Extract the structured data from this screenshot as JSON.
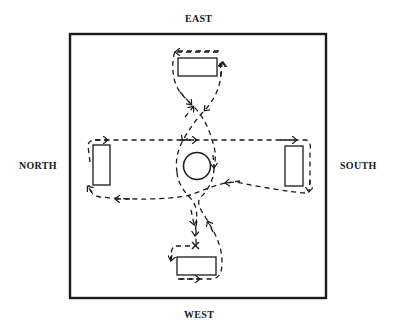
{
  "labels": {
    "top": "EAST",
    "left": "NORTH",
    "right": "SOUTH",
    "bottom": "WEST"
  },
  "colors": {
    "stroke": "#1a1a1a",
    "background": "#ffffff"
  },
  "elements": {
    "center": "circle",
    "stations": [
      "east-station",
      "north-station",
      "south-station",
      "west-station"
    ],
    "start_marker": "x"
  }
}
